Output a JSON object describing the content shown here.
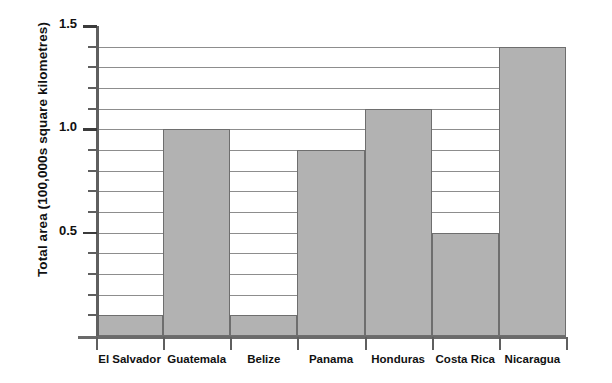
{
  "chart_data": {
    "type": "bar",
    "title": "",
    "xlabel": "",
    "ylabel": "Total area (100,000s square kilometres)",
    "categories": [
      "El Salvador",
      "Guatemala",
      "Belize",
      "Panama",
      "Honduras",
      "Costa Rica",
      "Nicaragua"
    ],
    "values": [
      0.1,
      1.0,
      0.1,
      0.9,
      1.1,
      0.5,
      1.4
    ],
    "ylim": [
      0,
      1.5
    ],
    "ytick_major": [
      "0.5",
      "1.0",
      "1.5"
    ],
    "ytick_major_values": [
      0.5,
      1.0,
      1.5
    ],
    "ytick_minor_values": [
      0.1,
      0.2,
      0.3,
      0.4,
      0.6,
      0.7,
      0.8,
      0.9,
      1.1,
      1.2,
      1.3,
      1.4
    ],
    "gridline_values": [
      0.1,
      0.2,
      0.3,
      0.4,
      0.5,
      0.6,
      0.7,
      0.8,
      0.9,
      1.0,
      1.1,
      1.2,
      1.3,
      1.4
    ],
    "grid": true,
    "legend": "none",
    "bar_fill_color": "#b2b2b2",
    "bar_border_color": "#6e6e6e",
    "gridline_color": "#8d8d8d",
    "axis_color": "#5f5f5f",
    "background_color": "#ffffff"
  }
}
